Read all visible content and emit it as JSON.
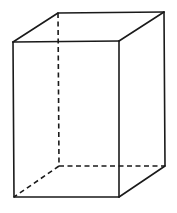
{
  "diagram": {
    "type": "rectangular-prism-wireframe",
    "stroke_color": "#1a1a1a",
    "background_color": "#ffffff",
    "vertices": {
      "front_top_left": [
        13,
        42
      ],
      "front_top_right": [
        119,
        41
      ],
      "front_bottom_left": [
        14,
        197
      ],
      "front_bottom_right": [
        119,
        197
      ],
      "back_top_left": [
        58,
        13
      ],
      "back_top_right": [
        164,
        12
      ],
      "back_bottom_left": [
        59,
        166
      ],
      "back_bottom_right": [
        165,
        166
      ]
    },
    "visible_edges": [
      {
        "from": "front_top_left",
        "to": "front_top_right"
      },
      {
        "from": "front_top_right",
        "to": "front_bottom_right"
      },
      {
        "from": "front_bottom_right",
        "to": "front_bottom_left"
      },
      {
        "from": "front_bottom_left",
        "to": "front_top_left"
      },
      {
        "from": "front_top_left",
        "to": "back_top_left"
      },
      {
        "from": "back_top_left",
        "to": "back_top_right"
      },
      {
        "from": "back_top_right",
        "to": "front_top_right"
      },
      {
        "from": "back_top_right",
        "to": "back_bottom_right"
      },
      {
        "from": "back_bottom_right",
        "to": "front_bottom_right"
      }
    ],
    "hidden_edges": [
      {
        "from": "back_top_left",
        "to": "back_bottom_left"
      },
      {
        "from": "back_bottom_left",
        "to": "back_bottom_right"
      },
      {
        "from": "back_bottom_left",
        "to": "front_bottom_left"
      }
    ]
  }
}
